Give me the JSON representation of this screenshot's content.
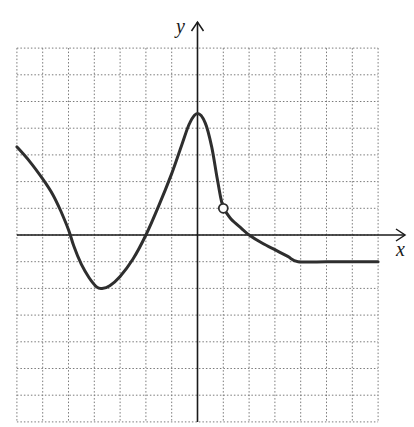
{
  "chart_data": {
    "type": "line",
    "title": "",
    "xlabel": "x",
    "ylabel": "y",
    "xlim": [
      -7,
      7
    ],
    "ylim": [
      -7,
      7
    ],
    "grid": true,
    "grid_step": 1,
    "tick_labels_shown": false,
    "series": [
      {
        "name": "f(x) left branch",
        "points": [
          [
            -7,
            3.3
          ],
          [
            -6.5,
            2.75
          ],
          [
            -6,
            2.1
          ],
          [
            -5.6,
            1.5
          ],
          [
            -5.3,
            0.9
          ],
          [
            -5.0,
            0.2
          ],
          [
            -4.8,
            -0.4
          ],
          [
            -4.5,
            -1.1
          ],
          [
            -4.2,
            -1.6
          ],
          [
            -3.9,
            -1.95
          ],
          [
            -3.7,
            -2.0
          ],
          [
            -3.4,
            -1.9
          ],
          [
            -3.0,
            -1.55
          ],
          [
            -2.5,
            -0.9
          ],
          [
            -2.0,
            0.0
          ],
          [
            -1.5,
            1.1
          ],
          [
            -1.0,
            2.3
          ],
          [
            -0.6,
            3.4
          ],
          [
            -0.3,
            4.2
          ],
          [
            0,
            4.55
          ],
          [
            0.3,
            4.2
          ],
          [
            0.55,
            3.3
          ],
          [
            0.75,
            2.2
          ],
          [
            0.9,
            1.4
          ],
          [
            1.0,
            1.0
          ]
        ],
        "endpoint": {
          "x": 1,
          "y": 1,
          "style": "open-circle"
        }
      },
      {
        "name": "f(x) right branch",
        "points": [
          [
            1.0,
            1.0
          ],
          [
            1.3,
            0.6
          ],
          [
            1.7,
            0.25
          ],
          [
            2.0,
            0.0
          ],
          [
            2.5,
            -0.3
          ],
          [
            3.0,
            -0.55
          ],
          [
            3.5,
            -0.8
          ],
          [
            3.9,
            -1.0
          ],
          [
            5,
            -1.0
          ],
          [
            6,
            -1.0
          ],
          [
            7,
            -1.0
          ]
        ]
      }
    ],
    "annotations": [
      {
        "type": "open-circle",
        "x": 1,
        "y": 1
      }
    ],
    "key_features": {
      "x_intercepts": [
        -5,
        -2,
        2
      ],
      "local_max": {
        "x": 0,
        "y": 4.5
      },
      "local_min": {
        "x": -3.7,
        "y": -2
      },
      "discontinuity": {
        "x": 1,
        "y": 1,
        "type": "hole"
      },
      "constant_segment": {
        "from_x": 4,
        "to_x": 7,
        "y": -1
      }
    }
  },
  "axes": {
    "x_label": "x",
    "y_label": "y"
  },
  "colors": {
    "curve": "#2e2e2e",
    "axis": "#1a1a1a",
    "grid": "#7a7a7a",
    "background": "#ffffff"
  }
}
